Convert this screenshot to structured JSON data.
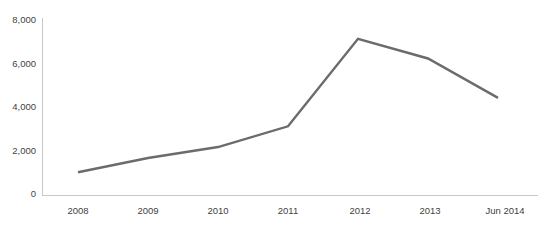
{
  "chart_data": {
    "type": "line",
    "title": "",
    "subtitle": "",
    "xlabel": "",
    "ylabel": "",
    "categories": [
      "2008",
      "2009",
      "2010",
      "2011",
      "2012",
      "2013",
      "Jun 2014"
    ],
    "series": [
      {
        "name": "",
        "values": [
          950,
          1600,
          2100,
          3050,
          7050,
          6150,
          4350
        ],
        "color": "#6b6b6b"
      }
    ],
    "ylim": [
      0,
      8000
    ],
    "yticks": [
      0,
      2000,
      4000,
      6000,
      8000
    ],
    "ytick_labels": [
      "0",
      "2,000",
      "4,000",
      "6,000",
      "8,000"
    ],
    "xtick_labels": [
      "2008",
      "2009",
      "2010",
      "2011",
      "2012",
      "2013",
      "Jun 2014"
    ],
    "grid": false,
    "legend": false,
    "legend_position": "none",
    "axis_color": "#c9c9c9",
    "tick_label_color": "#3f3f3f",
    "background_color": "#ffffff",
    "line_width": 2.4
  },
  "layout": {
    "plot_left": 42,
    "plot_right": 538,
    "plot_top": 18,
    "plot_bottom": 195,
    "x_first": 78,
    "x_step": 70,
    "y_zero": 193,
    "y_per_unit": 0.021725,
    "xlabel_y": 211
  }
}
